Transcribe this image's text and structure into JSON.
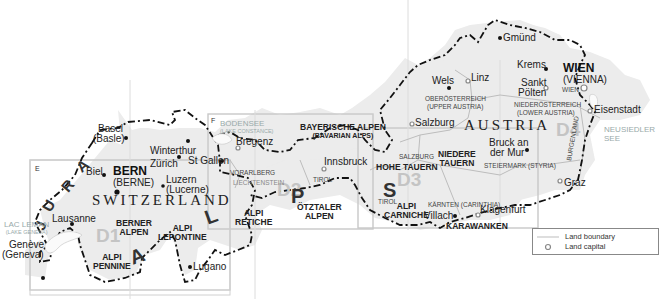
{
  "map": {
    "countries": [
      {
        "name": "SWITZERLAND"
      },
      {
        "name": "AUSTRIA"
      }
    ],
    "panels": [
      {
        "id": "D1",
        "corner": "E"
      },
      {
        "id": "D2",
        "corner": "F"
      },
      {
        "id": "D3"
      },
      {
        "id": "D4"
      }
    ],
    "region_letters": [
      "J",
      "U",
      "R",
      "A",
      "A",
      "L",
      "P",
      "S"
    ],
    "capitals": [
      {
        "name": "BERN",
        "alt": "(BERNE)"
      },
      {
        "name": "WIEN",
        "alt": "(VIENNA)"
      }
    ],
    "cities": {
      "basel": "Basel",
      "basel_alt": "(Basle)",
      "winterthur": "Winterthur",
      "zurich": "Zürich",
      "st_gallen": "St Gallen",
      "biel": "Biel",
      "luzern": "Luzern",
      "luzern_alt": "(Lucerne)",
      "lausanne": "Lausanne",
      "geneve": "Genève",
      "geneve_alt": "(Geneva)",
      "lugano": "Lugano",
      "bregenz": "Bregenz",
      "innsbruck": "Innsbruck",
      "salzburg": "Salzburg",
      "villach": "Villach",
      "klagenfurt": "Klagenfurt",
      "gmund": "Gmünd",
      "krems": "Krems",
      "sankt_polten_1": "Sankt",
      "sankt_polten_2": "Pölten",
      "wels": "Wels",
      "linz": "Linz",
      "eisenstadt": "Eisenstadt",
      "bruck_1": "Bruck an",
      "bruck_2": "der Mur",
      "graz": "Graz"
    },
    "lands": {
      "vorarlberg": "VORARLBERG",
      "liechtenstein": "LIECHTENSTEIN",
      "tirol_1": "TIROL",
      "tirol_2": "TIROL",
      "salzburg": "SALZBURG",
      "ooe_1": "OBERÖSTERREICH",
      "ooe_2": "(UPPER AUSTRIA)",
      "noe_1": "NIEDERÖSTERREICH",
      "noe_2": "(LOWER AUSTRIA)",
      "wien": "WIEN",
      "burgenland": "BURGENLAND",
      "steiermark": "STEIERMARK (STYRIA)",
      "karnten": "KÄRNTEN (CARINTHIA)"
    },
    "ranges": {
      "berner_1": "BERNER",
      "berner_2": "ALPEN",
      "pennine_1": "ALPI",
      "pennine_2": "PENNINE",
      "lepontine_1": "ALPI",
      "lepontine_2": "LEPONTINE",
      "retiche_1": "ALPI",
      "retiche_2": "RETICHE",
      "otztaler_1": "ÖTZTALER",
      "otztaler_2": "ALPEN",
      "bayerische_1": "BAYERISCHE ALPEN",
      "bayerische_2": "(BAVARIAN ALPS)",
      "hohe_tauern": "HOHE TAUERN",
      "niedere_1": "NIEDERE",
      "niedere_2": "TAUERN",
      "carniche_1": "ALPI",
      "carniche_2": "CARNICHE",
      "karawanken": "KARAWANKEN"
    },
    "lakes": {
      "leman": "LAC LEMAN",
      "leman_alt": "(LAKE GENEVA)",
      "bodensee": "BODENSEE",
      "bodensee_alt": "(LAKE CONSTANCE)",
      "neusiedler_1": "NEUSIEDLER",
      "neusiedler_2": "SEE"
    }
  },
  "legend": {
    "items": [
      {
        "label": "Land boundary",
        "symbol": "thin-gray-line"
      },
      {
        "label": "Land capital",
        "symbol": "gray-circle"
      }
    ]
  },
  "colors": {
    "land_fill": "#ececec",
    "panel_border": "#c8c8c8",
    "border_line": "#111111",
    "land_boundary": "#bdbdbd",
    "panel_id": "#c4c4c4"
  }
}
